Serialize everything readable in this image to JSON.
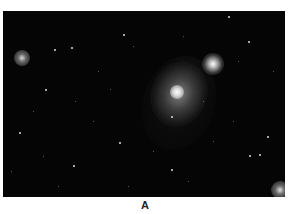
{
  "figure": {
    "caption_label": "A",
    "colors": {
      "sky": "#050505",
      "stars": "#dcdcdc",
      "background": "#ffffff",
      "caption": "#222222"
    }
  }
}
